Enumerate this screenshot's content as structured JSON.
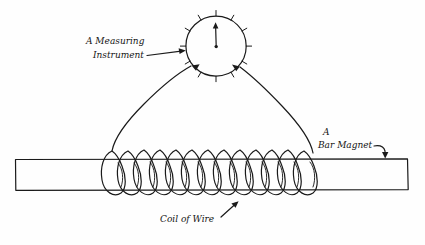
{
  "diagram": {
    "background_color": "#fefefe",
    "ink_color": "#1a1a1a",
    "style": "hand-drawn pen sketch"
  },
  "labels": {
    "instrument_line1": "A Measuring",
    "instrument_line2": "Instrument",
    "magnet_line1": "A",
    "magnet_line2": "Bar Magnet",
    "coil": "Coil of Wire"
  },
  "parts": {
    "gauge": {
      "name": "measuring instrument",
      "shape": "circle",
      "center_x": 216,
      "center_y": 46,
      "radius": 30,
      "tick_count": 12,
      "needle_direction": "up"
    },
    "bar_magnet": {
      "name": "bar magnet",
      "shape": "rectangle",
      "left": 15,
      "top": 159,
      "right": 408,
      "bottom": 190
    },
    "coil": {
      "name": "coil of wire",
      "loop_count": 13,
      "start_x": 112,
      "end_x": 316,
      "top_y": 151,
      "bottom_y": 198
    },
    "leads": {
      "name": "connecting wires",
      "count": 2,
      "left_from": "gauge lower-left",
      "right_from": "gauge lower-right"
    }
  },
  "annotations": {
    "instrument_arrow": "straight arrow pointing right",
    "magnet_arrow": "curved arrow hooking down",
    "coil_arrow": "straight arrow pointing up-right"
  }
}
